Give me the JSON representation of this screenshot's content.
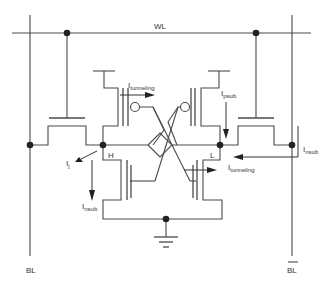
{
  "diagram": {
    "labels": {
      "wordline": "WL",
      "bitline": "BL",
      "bitline_bar": "BL",
      "node_high": "H",
      "node_low": "L"
    },
    "currents": {
      "tunneling_top": {
        "main": "I",
        "sub": "tunneling"
      },
      "psub": {
        "main": "I",
        "sub": "psub"
      },
      "junction": {
        "main": "I",
        "sub": "j"
      },
      "nsub_left": {
        "main": "I",
        "sub": "nsub"
      },
      "nsub_right": {
        "main": "I",
        "sub": "nsub"
      },
      "tunneling_bottom": {
        "main": "I",
        "sub": "tunneling"
      }
    },
    "colors": {
      "wire": "#4a4a4a",
      "node": "#222222",
      "text": "#333333",
      "background": "#ffffff"
    }
  }
}
